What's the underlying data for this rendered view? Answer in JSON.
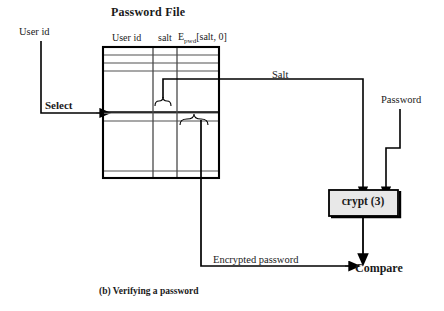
{
  "figure": {
    "title": "Password File",
    "caption": "(b) Verifying a password",
    "accent_color": "#000000",
    "box_fill": "#e8e8e8",
    "row_line_color": "#808080"
  },
  "table": {
    "title": "Password File",
    "columns": [
      {
        "name": "user-id",
        "label": "User id"
      },
      {
        "name": "salt",
        "label": "salt"
      },
      {
        "name": "encrypted-password",
        "label": "E",
        "subscript": "pwd",
        "suffix": "[salt, 0]"
      }
    ],
    "rows": 8,
    "selected_row_index": 4
  },
  "labels": {
    "user_id_input": "User id",
    "select": "Select",
    "salt_flow": "Salt",
    "password_input": "Password",
    "encrypted_password_flow": "Encrypted password",
    "compare": "Compare"
  },
  "nodes": {
    "crypt": {
      "label": "crypt (3)"
    },
    "compare": {
      "label": "Compare"
    }
  },
  "icons": {
    "brace_salt": "curly-brace-icon",
    "brace_hash": "curly-brace-icon",
    "arrow_select": "arrow-right-icon",
    "arrow_salt_to_crypt": "arrow-down-icon",
    "arrow_password_to_crypt": "arrow-down-icon",
    "arrow_crypt_to_compare": "arrow-down-icon",
    "arrow_encrypted_to_compare": "arrow-right-icon"
  }
}
